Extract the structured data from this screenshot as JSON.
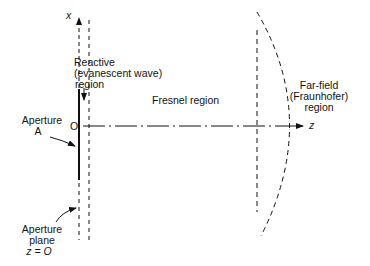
{
  "diagram": {
    "axes": {
      "x_label": "x",
      "z_label": "z",
      "origin_label": "O"
    },
    "regions": {
      "reactive": [
        "Reactive",
        "(evanescent wave)",
        "region"
      ],
      "fresnel": "Fresnel region",
      "far_field": [
        "Far-field",
        "(Fraunhofer)",
        "region"
      ]
    },
    "annotations": {
      "aperture": [
        "Aperture",
        "A"
      ],
      "aperture_plane": [
        "Aperture",
        "plane",
        "z = O"
      ]
    },
    "colors": {
      "ink": "#111111",
      "background": "#ffffff"
    }
  }
}
